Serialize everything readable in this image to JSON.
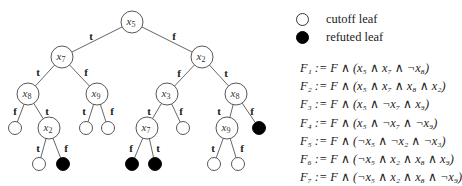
{
  "colors": {
    "edge": "#555555",
    "node_stroke": "#444444",
    "refuted_fill": "#000000",
    "cutoff_fill": "#ffffff"
  },
  "tree": {
    "nodes": [
      {
        "id": "n0",
        "label": "x5",
        "sub": "5",
        "base": "x",
        "x": 132,
        "y": 22,
        "type": "var"
      },
      {
        "id": "n1",
        "label": "x7",
        "sub": "7",
        "base": "x",
        "x": 62,
        "y": 57,
        "type": "var"
      },
      {
        "id": "n2",
        "label": "x2",
        "sub": "2",
        "base": "x",
        "x": 202,
        "y": 57,
        "type": "var"
      },
      {
        "id": "n3",
        "label": "x8",
        "sub": "8",
        "base": "x",
        "x": 28,
        "y": 94,
        "type": "var"
      },
      {
        "id": "n4",
        "label": "x9",
        "sub": "9",
        "base": "x",
        "x": 97,
        "y": 94,
        "type": "var"
      },
      {
        "id": "n5",
        "label": "x3",
        "sub": "3",
        "base": "x",
        "x": 167,
        "y": 94,
        "type": "var"
      },
      {
        "id": "n6",
        "label": "x8",
        "sub": "8",
        "base": "x",
        "x": 236,
        "y": 94,
        "type": "var"
      },
      {
        "id": "n7",
        "x": 15,
        "y": 128,
        "type": "cutoff"
      },
      {
        "id": "n8",
        "label": "x2",
        "sub": "2",
        "base": "x",
        "x": 49,
        "y": 128,
        "type": "var"
      },
      {
        "id": "n9",
        "x": 86,
        "y": 128,
        "type": "cutoff"
      },
      {
        "id": "n10",
        "x": 108,
        "y": 128,
        "type": "cutoff"
      },
      {
        "id": "n11",
        "label": "x7",
        "sub": "7",
        "base": "x",
        "x": 147,
        "y": 128,
        "type": "var"
      },
      {
        "id": "n12",
        "x": 183,
        "y": 128,
        "type": "cutoff"
      },
      {
        "id": "n13",
        "label": "x9",
        "sub": "9",
        "base": "x",
        "x": 227,
        "y": 128,
        "type": "var"
      },
      {
        "id": "n14",
        "x": 259,
        "y": 128,
        "type": "refuted"
      },
      {
        "id": "n15",
        "x": 39,
        "y": 164,
        "type": "cutoff"
      },
      {
        "id": "n16",
        "x": 63,
        "y": 164,
        "type": "refuted"
      },
      {
        "id": "n17",
        "x": 132,
        "y": 164,
        "type": "refuted"
      },
      {
        "id": "n18",
        "x": 155,
        "y": 164,
        "type": "refuted"
      },
      {
        "id": "n19",
        "x": 214,
        "y": 164,
        "type": "cutoff"
      },
      {
        "id": "n20",
        "x": 238,
        "y": 164,
        "type": "cutoff"
      }
    ],
    "edges": [
      {
        "from": "n0",
        "to": "n1",
        "label": "t",
        "lx": 91,
        "ly": 36
      },
      {
        "from": "n0",
        "to": "n2",
        "label": "f",
        "lx": 174,
        "ly": 36
      },
      {
        "from": "n1",
        "to": "n3",
        "label": "t",
        "lx": 38,
        "ly": 72
      },
      {
        "from": "n1",
        "to": "n4",
        "label": "f",
        "lx": 86,
        "ly": 72
      },
      {
        "from": "n2",
        "to": "n5",
        "label": "f",
        "lx": 179,
        "ly": 73
      },
      {
        "from": "n2",
        "to": "n6",
        "label": "t",
        "lx": 226,
        "ly": 73
      },
      {
        "from": "n3",
        "to": "n7",
        "label": "f",
        "lx": 15,
        "ly": 111
      },
      {
        "from": "n3",
        "to": "n8",
        "label": "t",
        "lx": 47,
        "ly": 111
      },
      {
        "from": "n4",
        "to": "n9",
        "label": "t",
        "lx": 84,
        "ly": 111
      },
      {
        "from": "n4",
        "to": "n10",
        "label": "f",
        "lx": 112,
        "ly": 111
      },
      {
        "from": "n5",
        "to": "n11",
        "label": "t",
        "lx": 149,
        "ly": 111
      },
      {
        "from": "n5",
        "to": "n12",
        "label": "f",
        "lx": 181,
        "ly": 111
      },
      {
        "from": "n6",
        "to": "n13",
        "label": "t",
        "lx": 219,
        "ly": 111
      },
      {
        "from": "n6",
        "to": "n14",
        "label": "f",
        "lx": 252,
        "ly": 111
      },
      {
        "from": "n8",
        "to": "n15",
        "label": "t",
        "lx": 38,
        "ly": 148
      },
      {
        "from": "n8",
        "to": "n16",
        "label": "f",
        "lx": 66,
        "ly": 148
      },
      {
        "from": "n11",
        "to": "n17",
        "label": "f",
        "lx": 131,
        "ly": 148
      },
      {
        "from": "n11",
        "to": "n18",
        "label": "t",
        "lx": 158,
        "ly": 148
      },
      {
        "from": "n13",
        "to": "n19",
        "label": "t",
        "lx": 213,
        "ly": 148
      },
      {
        "from": "n13",
        "to": "n20",
        "label": "f",
        "lx": 242,
        "ly": 148
      }
    ],
    "var_radius": 11,
    "leaf_radius": 6.5
  },
  "legend": {
    "items": [
      {
        "icon": "open-circle-icon",
        "label": "cutoff leaf",
        "type": "cutoff"
      },
      {
        "icon": "filled-circle-icon",
        "label": "refuted leaf",
        "type": "refuted"
      }
    ]
  },
  "formulas": [
    "F₁ := F ∧ (x₅ ∧ x₇ ∧ ¬x₈)",
    "F₂ := F ∧ (x₅ ∧ x₇ ∧ x₈ ∧ x₂)",
    "F₃ := F ∧ (x₅ ∧ ¬x₇ ∧ x₉)",
    "F₄ := F ∧ (x₅ ∧ ¬x₇ ∧ ¬x₉)",
    "F₅ := F ∧ (¬x₅ ∧ ¬x₂ ∧ ¬x₃)",
    "F₆ := F ∧ (¬x₅ ∧ x₂ ∧ x₈ ∧ x₉)",
    "F₇ := F ∧ (¬x₅ ∧ x₂ ∧ x₈ ∧ ¬x₉)"
  ]
}
